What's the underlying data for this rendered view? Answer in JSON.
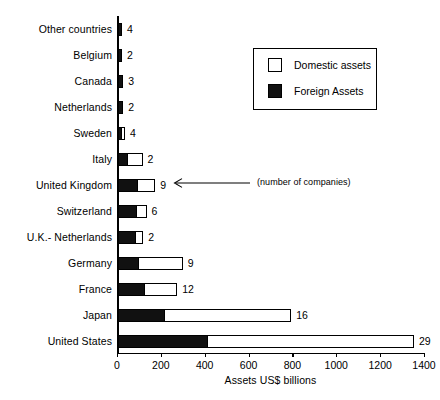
{
  "chart_data": {
    "type": "bar",
    "orientation": "horizontal",
    "stacked": true,
    "title": "",
    "xlabel": "Assets US$ billions",
    "ylabel": "",
    "xlim": [
      0,
      1400
    ],
    "xticks": [
      0,
      200,
      400,
      600,
      800,
      1000,
      1200,
      1400
    ],
    "grid": false,
    "legend_position": "upper right",
    "categories": [
      "Other countries",
      "Belgium",
      "Canada",
      "Netherlands",
      "Sweden",
      "Italy",
      "United Kingdom",
      "Switzerland",
      "U.K.- Netherlands",
      "Germany",
      "France",
      "Japan",
      "United States"
    ],
    "series": [
      {
        "name": "Foreign Assets",
        "color": "#111111",
        "values": [
          18,
          18,
          24,
          24,
          20,
          45,
          90,
          85,
          80,
          95,
          125,
          215,
          410
        ]
      },
      {
        "name": "Domestic assets",
        "color": "#ffffff",
        "values": [
          0,
          0,
          0,
          0,
          12,
          67,
          80,
          45,
          35,
          200,
          145,
          575,
          940
        ]
      }
    ],
    "totals": [
      18,
      18,
      24,
      24,
      32,
      112,
      170,
      130,
      115,
      295,
      270,
      790,
      1350
    ],
    "point_labels": [
      "4",
      "2",
      "3",
      "2",
      "4",
      "2",
      "9",
      "6",
      "2",
      "9",
      "12",
      "16",
      "29"
    ],
    "point_label_meaning": "number of companies",
    "annotations": [
      {
        "text": "(number of companies)",
        "kind": "arrow-note",
        "points_to": "United Kingdom"
      }
    ]
  },
  "legend": {
    "items": [
      {
        "label": "Domestic assets",
        "swatch": "white-square"
      },
      {
        "label": "Foreign Assets",
        "swatch": "black-square"
      }
    ]
  },
  "axis": {
    "x_title": "Assets US$ billions",
    "tick_labels": [
      "0",
      "200",
      "400",
      "600",
      "800",
      "1000",
      "1200",
      "1400"
    ]
  },
  "annotation": {
    "note": "(number of companies)"
  },
  "colors": {
    "foreign": "#111111",
    "domestic": "#ffffff",
    "axis": "#000000",
    "background": "#ffffff"
  }
}
